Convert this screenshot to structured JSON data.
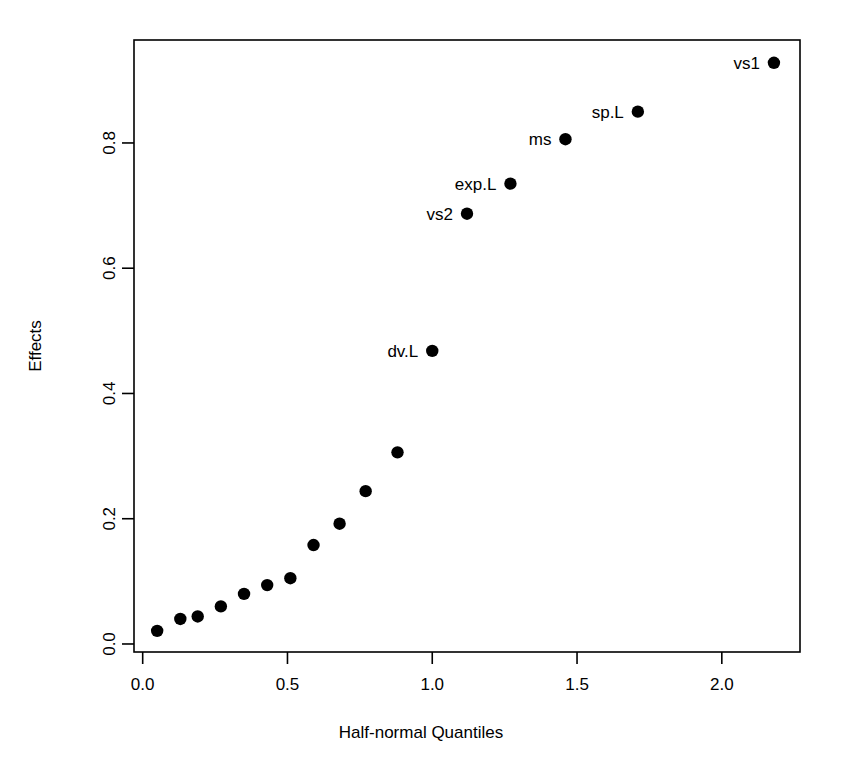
{
  "chart_data": {
    "type": "scatter",
    "title": "",
    "xlabel": "Half-normal Quantiles",
    "ylabel": "Effects",
    "xlim": [
      -0.03,
      2.27
    ],
    "ylim": [
      -0.0128,
      0.9644
    ],
    "grid": false,
    "legend": "none",
    "xticks": [
      0.0,
      0.5,
      1.0,
      1.5,
      2.0
    ],
    "xtick_labels": [
      "0.0",
      "0.5",
      "1.0",
      "1.5",
      "2.0"
    ],
    "yticks": [
      0.0,
      0.2,
      0.4,
      0.6,
      0.8
    ],
    "ytick_labels": [
      "0.0",
      "0.2",
      "0.4",
      "0.6",
      "0.8"
    ],
    "marker": "filled-circle",
    "marker_color": "#000000",
    "points": [
      {
        "x": 0.05,
        "y": 0.021,
        "label": ""
      },
      {
        "x": 0.13,
        "y": 0.04,
        "label": ""
      },
      {
        "x": 0.19,
        "y": 0.044,
        "label": ""
      },
      {
        "x": 0.27,
        "y": 0.06,
        "label": ""
      },
      {
        "x": 0.35,
        "y": 0.08,
        "label": ""
      },
      {
        "x": 0.43,
        "y": 0.094,
        "label": ""
      },
      {
        "x": 0.51,
        "y": 0.105,
        "label": ""
      },
      {
        "x": 0.59,
        "y": 0.158,
        "label": ""
      },
      {
        "x": 0.68,
        "y": 0.192,
        "label": ""
      },
      {
        "x": 0.77,
        "y": 0.244,
        "label": ""
      },
      {
        "x": 0.88,
        "y": 0.306,
        "label": ""
      },
      {
        "x": 1.0,
        "y": 0.468,
        "label": "dv.L",
        "label_side": "left"
      },
      {
        "x": 1.12,
        "y": 0.687,
        "label": "vs2",
        "label_side": "left"
      },
      {
        "x": 1.27,
        "y": 0.735,
        "label": "exp.L",
        "label_side": "left"
      },
      {
        "x": 1.46,
        "y": 0.806,
        "label": "ms",
        "label_side": "left"
      },
      {
        "x": 1.71,
        "y": 0.85,
        "label": "sp.L",
        "label_side": "left"
      },
      {
        "x": 2.18,
        "y": 0.928,
        "label": "vs1",
        "label_side": "left"
      }
    ]
  },
  "labels": {
    "x_axis_title": "Half-normal Quantiles",
    "y_axis_title": "Effects"
  }
}
